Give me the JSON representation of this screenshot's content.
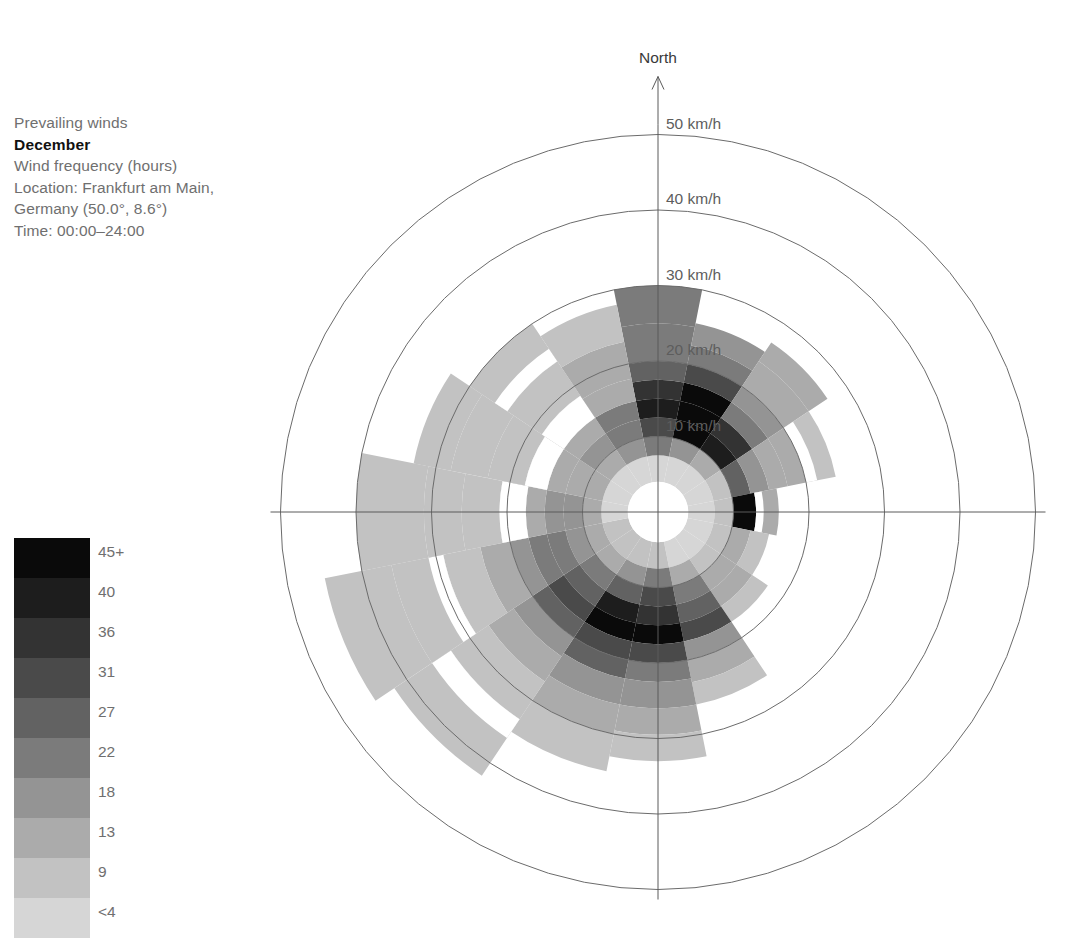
{
  "caption": {
    "line1": "Prevailing winds",
    "month": "December",
    "line3": "Wind frequency (hours)",
    "line4": "Location: Frankfurt am Main,",
    "line5": "Germany (50.0°, 8.6°)",
    "line6": "Time: 00:00–24:00"
  },
  "compass": {
    "north_label": "North"
  },
  "legend": {
    "title": "Wind frequency (hours)",
    "labels": [
      "45+",
      "40",
      "36",
      "31",
      "27",
      "22",
      "18",
      "13",
      "9",
      "<4"
    ],
    "colors": [
      "#0a0a0a",
      "#1d1d1d",
      "#333333",
      "#4a4a4a",
      "#626262",
      "#7b7b7b",
      "#949494",
      "#ababab",
      "#c2c2c2",
      "#d6d6d6"
    ]
  },
  "chart_data": {
    "type": "bar",
    "subtype": "wind-rose",
    "sublabel": "Wind frequency (hours)",
    "location": "Frankfurt am Main, Germany (50.0°, 8.6°)",
    "time_range": "00:00–24:00",
    "radial_axis": {
      "label": "km/h",
      "ticks": [
        10,
        20,
        30,
        40,
        50
      ],
      "tick_labels": [
        "10 km/h",
        "20 km/h",
        "30 km/h",
        "40 km/h",
        "50 km/h"
      ],
      "rmin": 0,
      "rmax": 55,
      "inner_hole": 4,
      "grid": true
    },
    "angular_axis": {
      "directions": [
        "N",
        "NNE",
        "NE",
        "ENE",
        "E",
        "ESE",
        "SE",
        "SSE",
        "S",
        "SSW",
        "SW",
        "WSW",
        "W",
        "WNW",
        "NW",
        "NNW"
      ],
      "sector_count": 16,
      "sector_width_deg": 22.5,
      "zero_at": "North",
      "direction": "clockwise"
    },
    "legend": {
      "position": "left",
      "title": "hours",
      "bin_labels": [
        "<4",
        "9",
        "13",
        "18",
        "22",
        "27",
        "31",
        "36",
        "40",
        "45+"
      ],
      "bin_colors": [
        "#d6d6d6",
        "#c2c2c2",
        "#ababab",
        "#949494",
        "#7b7b7b",
        "#626262",
        "#4a4a4a",
        "#333333",
        "#1d1d1d",
        "#0a0a0a"
      ]
    },
    "note": "Each sector is a stack of speed-bin segments; 'segments' lists [outer_radius_kmh, hours_bin_index] from the hole outward. hours_bin_index maps into legend.bin_colors (0 = <4 hours, 9 = 45+ hours). Gaps (white) are bins with no recorded hours.",
    "series": [
      {
        "name": "N",
        "outer_kmh": 30.0,
        "segments": [
          [
            7.5,
            0
          ],
          [
            10.0,
            4
          ],
          [
            12.5,
            6
          ],
          [
            15.0,
            8
          ],
          [
            17.5,
            7
          ],
          [
            20.0,
            5
          ],
          [
            25.0,
            4
          ],
          [
            30.0,
            4
          ]
        ]
      },
      {
        "name": "NNE",
        "outer_kmh": 25.5,
        "segments": [
          [
            7.5,
            0
          ],
          [
            10.0,
            3
          ],
          [
            12.5,
            9
          ],
          [
            15.0,
            9
          ],
          [
            17.5,
            9
          ],
          [
            20.0,
            6
          ],
          [
            22.5,
            4
          ],
          [
            25.5,
            3
          ]
        ]
      },
      {
        "name": "NE",
        "outer_kmh": 27.0,
        "segments": [
          [
            7.5,
            0
          ],
          [
            10.0,
            2
          ],
          [
            12.5,
            8
          ],
          [
            15.0,
            7
          ],
          [
            17.5,
            4
          ],
          [
            20.0,
            3
          ],
          [
            24.0,
            2
          ],
          [
            27.0,
            2
          ]
        ]
      },
      {
        "name": "ENE",
        "outer_kmh": 24.0,
        "segments": [
          [
            7.5,
            0
          ],
          [
            10.0,
            1
          ],
          [
            12.5,
            5
          ],
          [
            15.0,
            3
          ],
          [
            17.5,
            2
          ],
          [
            20.0,
            2
          ],
          [
            24.0,
            1
          ]
        ]
      },
      {
        "name": "E",
        "outer_kmh": 16.0,
        "segments": [
          [
            7.5,
            0
          ],
          [
            10.0,
            1
          ],
          [
            13.0,
            9
          ],
          [
            16.0,
            2
          ]
        ]
      },
      {
        "name": "ESE",
        "outer_kmh": 15.0,
        "segments": [
          [
            7.5,
            0
          ],
          [
            10.0,
            1
          ],
          [
            12.5,
            2
          ],
          [
            15.0,
            1
          ]
        ]
      },
      {
        "name": "SE",
        "outer_kmh": 17.5,
        "segments": [
          [
            7.5,
            0
          ],
          [
            10.0,
            1
          ],
          [
            12.5,
            2
          ],
          [
            15.0,
            2
          ],
          [
            17.5,
            1
          ]
        ]
      },
      {
        "name": "SSE",
        "outer_kmh": 26.0,
        "segments": [
          [
            7.5,
            0
          ],
          [
            10.0,
            2
          ],
          [
            12.5,
            4
          ],
          [
            15.0,
            5
          ],
          [
            17.5,
            6
          ],
          [
            20.0,
            3
          ],
          [
            23.0,
            2
          ],
          [
            26.0,
            1
          ]
        ]
      },
      {
        "name": "S",
        "outer_kmh": 33.0,
        "segments": [
          [
            7.5,
            1
          ],
          [
            10.0,
            4
          ],
          [
            12.5,
            6
          ],
          [
            15.0,
            7
          ],
          [
            17.5,
            9
          ],
          [
            20.0,
            6
          ],
          [
            22.5,
            4
          ],
          [
            26.0,
            3
          ],
          [
            29.5,
            2
          ],
          [
            33.0,
            1
          ]
        ]
      },
      {
        "name": "SSW",
        "outer_kmh": 35.0,
        "segments": [
          [
            7.5,
            1
          ],
          [
            10.0,
            3
          ],
          [
            12.5,
            5
          ],
          [
            15.0,
            8
          ],
          [
            17.5,
            9
          ],
          [
            20.0,
            6
          ],
          [
            22.5,
            5
          ],
          [
            26.0,
            3
          ],
          [
            30.0,
            2
          ],
          [
            35.0,
            1
          ]
        ]
      },
      {
        "name": "SW",
        "outer_kmh": 42.0,
        "segments": [
          [
            7.5,
            1
          ],
          [
            10.0,
            2
          ],
          [
            12.5,
            4
          ],
          [
            15.0,
            5
          ],
          [
            17.5,
            6
          ],
          [
            20.0,
            5
          ],
          [
            23.0,
            3
          ],
          [
            27.0,
            2
          ],
          [
            33.0,
            1
          ],
          [
            42.0,
            1
          ]
        ]
      },
      {
        "name": "WSW",
        "outer_kmh": 45.0,
        "segments": [
          [
            7.5,
            1
          ],
          [
            10.0,
            2
          ],
          [
            12.5,
            3
          ],
          [
            15.0,
            4
          ],
          [
            17.5,
            4
          ],
          [
            20.0,
            3
          ],
          [
            24.0,
            2
          ],
          [
            29.0,
            1
          ],
          [
            36.0,
            1
          ],
          [
            45.0,
            1
          ]
        ]
      },
      {
        "name": "W",
        "outer_kmh": 40.0,
        "segments": [
          [
            7.5,
            0
          ],
          [
            10.0,
            2
          ],
          [
            12.5,
            3
          ],
          [
            15.0,
            3
          ],
          [
            17.5,
            2
          ],
          [
            21.0,
            2
          ],
          [
            26.0,
            1
          ],
          [
            31.0,
            1
          ],
          [
            40.0,
            1
          ]
        ]
      },
      {
        "name": "WNW",
        "outer_kmh": 33.0,
        "segments": [
          [
            7.5,
            0
          ],
          [
            10.0,
            2
          ],
          [
            12.5,
            2
          ],
          [
            15.0,
            2
          ],
          [
            18.0,
            1
          ],
          [
            23.0,
            1
          ],
          [
            28.0,
            1
          ],
          [
            33.0,
            1
          ]
        ]
      },
      {
        "name": "NW",
        "outer_kmh": 30.0,
        "segments": [
          [
            7.5,
            0
          ],
          [
            10.0,
            2
          ],
          [
            12.5,
            3
          ],
          [
            15.0,
            2
          ],
          [
            18.5,
            1
          ],
          [
            24.0,
            1
          ],
          [
            30.0,
            1
          ]
        ]
      },
      {
        "name": "NNW",
        "outer_kmh": 28.0,
        "segments": [
          [
            7.5,
            0
          ],
          [
            10.0,
            3
          ],
          [
            12.5,
            4
          ],
          [
            15.0,
            4
          ],
          [
            18.0,
            2
          ],
          [
            23.0,
            2
          ],
          [
            28.0,
            1
          ]
        ]
      }
    ],
    "gaps": [
      {
        "sector": "NW",
        "from_kmh": 15.0,
        "to_kmh": 18.5
      },
      {
        "sector": "WNW",
        "from_kmh": 15.0,
        "to_kmh": 18.0
      },
      {
        "sector": "W",
        "from_kmh": 17.5,
        "to_kmh": 21.0
      },
      {
        "sector": "NW",
        "from_kmh": 24.0,
        "to_kmh": 26.0
      },
      {
        "sector": "WSW",
        "from_kmh": 29.0,
        "to_kmh": 31.0
      },
      {
        "sector": "SW",
        "from_kmh": 33.0,
        "to_kmh": 36.0
      },
      {
        "sector": "ENE",
        "from_kmh": 20.0,
        "to_kmh": 21.5
      },
      {
        "sector": "E",
        "from_kmh": 13.0,
        "to_kmh": 14.0
      }
    ]
  }
}
